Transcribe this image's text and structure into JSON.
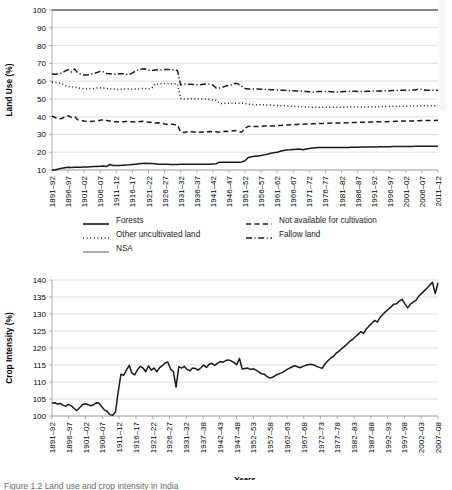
{
  "figure": {
    "caption": "Figure 1.2 Land use and crop intensity in India"
  },
  "chart_data": [
    {
      "id": "land-use",
      "type": "line",
      "title": "",
      "xlabel": "Years",
      "ylabel": "Land Use (%)",
      "ylim": [
        10,
        100
      ],
      "yticks": [
        10,
        20,
        30,
        40,
        50,
        60,
        70,
        80,
        90,
        100
      ],
      "ytick_labels": [
        "10",
        "20",
        "30",
        "40",
        "50",
        "60",
        "70",
        "80",
        "90",
        "100"
      ],
      "grid": true,
      "legend_position": "bottom",
      "categories": [
        "1891–92",
        "1896–97",
        "1901–02",
        "1906–07",
        "1911–12",
        "1916–17",
        "1921–22",
        "1926–27",
        "1931–32",
        "1936–37",
        "1941–42",
        "1946–47",
        "1951–52",
        "1956–57",
        "1961–62",
        "1966–67",
        "1971–72",
        "1976–77",
        "1981–82",
        "1986–87",
        "1991–92",
        "1996–97",
        "2001–02",
        "2006–07",
        "2011–12"
      ],
      "xtick_every": 5,
      "x_start_year": 1891,
      "x_end_year": 2012,
      "series": [
        {
          "name": "Forests",
          "style": "solid",
          "color": "#1a1a1a",
          "values": [
            9.9,
            10.0,
            10.6,
            11.0,
            11.3,
            11.5,
            11.4,
            11.6,
            11.5,
            11.6,
            11.7,
            11.7,
            11.8,
            11.9,
            12.0,
            12.1,
            12.2,
            12.0,
            13.1,
            12.5,
            12.6,
            12.6,
            12.7,
            12.8,
            12.9,
            13.1,
            13.3,
            13.5,
            13.7,
            13.8,
            13.6,
            13.6,
            13.5,
            13.3,
            13.2,
            13.2,
            13.2,
            13.1,
            13.1,
            13.1,
            13.2,
            13.2,
            13.2,
            13.2,
            13.2,
            13.2,
            13.3,
            13.3,
            13.3,
            13.3,
            13.4,
            13.5,
            14.3,
            14.4,
            14.4,
            14.4,
            14.4,
            14.4,
            14.4,
            14.5,
            15.2,
            17.0,
            17.4,
            17.7,
            17.9,
            18.1,
            18.5,
            18.9,
            19.4,
            19.7,
            20.0,
            20.5,
            21.0,
            21.3,
            21.4,
            21.6,
            21.7,
            21.8,
            21.4,
            21.8,
            22.1,
            22.4,
            22.5,
            22.6,
            22.6,
            22.6,
            22.6,
            22.6,
            22.6,
            22.7,
            22.7,
            22.7,
            22.7,
            22.8,
            22.8,
            22.8,
            22.9,
            22.9,
            22.9,
            23.0,
            23.0,
            23.0,
            23.1,
            23.1,
            23.1,
            23.1,
            23.2,
            23.2,
            23.2,
            23.2,
            23.2,
            23.2,
            23.2,
            23.3,
            23.3,
            23.3,
            23.3,
            23.3,
            23.3,
            23.3,
            23.3
          ],
          "description": "Forests rise from about 10% in 1891–92 to about 23% by 2011–12"
        },
        {
          "name": "Not available for cultivation",
          "style": "dashed",
          "color": "#1a1a1a",
          "values": [
            40.4,
            39.5,
            38.8,
            39.0,
            39.8,
            40.5,
            39.6,
            40.1,
            38.3,
            37.8,
            37.5,
            37.4,
            37.3,
            37.4,
            37.5,
            38.0,
            38.4,
            37.8,
            37.6,
            37.2,
            37.1,
            37.0,
            37.2,
            37.3,
            37.2,
            37.1,
            37.0,
            37.2,
            37.4,
            37.2,
            36.9,
            36.9,
            36.5,
            36.6,
            36.3,
            35.9,
            35.6,
            35.7,
            35.6,
            35.4,
            31.3,
            31.1,
            31.5,
            31.6,
            31.4,
            31.3,
            31.2,
            31.4,
            31.5,
            31.6,
            31.5,
            31.5,
            31.3,
            31.6,
            31.8,
            31.7,
            32.0,
            32.2,
            31.6,
            31.3,
            33.5,
            34.5,
            34.6,
            34.4,
            34.5,
            34.6,
            34.7,
            34.7,
            34.8,
            34.7,
            35.0,
            35.1,
            35.2,
            35.3,
            35.4,
            35.5,
            35.6,
            35.7,
            35.8,
            35.9,
            35.9,
            36.0,
            36.0,
            36.1,
            36.2,
            36.2,
            36.3,
            36.4,
            36.4,
            36.5,
            36.5,
            36.6,
            36.6,
            36.7,
            36.7,
            36.8,
            36.8,
            36.9,
            36.9,
            37.0,
            37.0,
            37.1,
            37.1,
            37.2,
            37.2,
            37.3,
            37.3,
            37.4,
            37.4,
            37.5,
            37.5,
            37.6,
            37.6,
            37.7,
            37.7,
            37.8,
            37.8,
            37.8,
            37.9,
            37.9,
            38.0
          ],
          "description": "Not available for cultivation falls from about 40% to about 31% near 1931–32 then rises to about 38%"
        },
        {
          "name": "Other uncultivated land",
          "style": "dotted",
          "color": "#1a1a1a",
          "values": [
            59.5,
            59.2,
            59.0,
            58.6,
            57.6,
            57.0,
            56.7,
            56.8,
            56.2,
            55.9,
            55.7,
            55.6,
            55.8,
            55.9,
            56.1,
            56.2,
            56.1,
            55.9,
            55.5,
            55.6,
            55.4,
            55.3,
            55.5,
            55.6,
            55.5,
            55.4,
            55.6,
            55.6,
            55.8,
            55.8,
            55.6,
            56.0,
            58.3,
            58.4,
            58.6,
            58.6,
            58.6,
            58.5,
            58.5,
            58.4,
            50.2,
            49.9,
            50.0,
            50.1,
            50.0,
            49.9,
            49.9,
            49.9,
            49.8,
            49.7,
            49.5,
            49.2,
            47.5,
            47.4,
            47.5,
            47.6,
            47.5,
            47.5,
            47.6,
            47.6,
            47.4,
            47.0,
            46.9,
            46.8,
            46.7,
            46.7,
            46.6,
            46.5,
            46.5,
            46.4,
            46.3,
            46.2,
            46.1,
            46.0,
            45.9,
            45.8,
            45.7,
            45.6,
            45.5,
            45.4,
            45.4,
            45.3,
            45.3,
            45.3,
            45.3,
            45.3,
            45.3,
            45.3,
            45.3,
            45.3,
            45.3,
            45.4,
            45.4,
            45.4,
            45.4,
            45.4,
            45.5,
            45.5,
            45.5,
            45.6,
            45.6,
            45.6,
            45.7,
            45.7,
            45.7,
            45.8,
            45.8,
            45.8,
            45.9,
            45.9,
            45.9,
            46.0,
            46.0,
            46.0,
            46.0,
            46.1,
            46.1,
            46.1,
            46.2,
            46.2,
            46.2
          ],
          "description": "Other uncultivated land falls from about 59% to about 46%"
        },
        {
          "name": "Fallow land",
          "style": "dashdot",
          "color": "#1a1a1a",
          "values": [
            64.1,
            63.8,
            64.0,
            64.4,
            65.6,
            66.4,
            65.2,
            66.8,
            64.6,
            63.8,
            63.4,
            63.5,
            63.9,
            64.2,
            64.8,
            65.6,
            65.2,
            64.3,
            64.2,
            63.9,
            63.8,
            64.1,
            64.2,
            63.9,
            63.6,
            64.6,
            65.8,
            66.4,
            66.8,
            66.9,
            66.1,
            66.0,
            66.3,
            66.4,
            66.3,
            66.5,
            66.6,
            66.3,
            66.2,
            66.0,
            57.8,
            58.4,
            58.3,
            58.2,
            58.1,
            58.0,
            57.9,
            58.2,
            58.4,
            58.3,
            57.8,
            56.1,
            56.1,
            56.5,
            57.2,
            57.6,
            58.0,
            58.8,
            58.3,
            57.1,
            55.9,
            55.6,
            55.5,
            55.6,
            55.5,
            55.4,
            55.3,
            55.3,
            55.2,
            55.1,
            55.0,
            54.9,
            54.8,
            54.7,
            54.6,
            54.6,
            54.5,
            54.4,
            54.2,
            54.1,
            54.0,
            53.9,
            54.0,
            54.1,
            54.2,
            54.2,
            54.1,
            54.0,
            53.9,
            53.9,
            54.0,
            54.1,
            54.2,
            54.3,
            54.3,
            54.2,
            54.2,
            54.2,
            54.3,
            54.3,
            54.4,
            54.4,
            54.5,
            54.5,
            54.6,
            54.6,
            54.7,
            54.7,
            54.8,
            54.8,
            54.9,
            54.9,
            55.0,
            55.0,
            55.6,
            55.4,
            54.9,
            54.8,
            54.8,
            54.9,
            54.9
          ],
          "description": "Fallow land hovers near 64–66% until 1931–32 then drops to about 55%"
        },
        {
          "name": "NSA",
          "style": "solid-thin",
          "color": "#5a5a5a",
          "values": [
            100,
            100,
            100,
            100,
            100,
            100,
            100,
            100,
            100,
            100,
            100,
            100,
            100,
            100,
            100,
            100,
            100,
            100,
            100,
            100,
            100,
            100,
            100,
            100,
            100,
            100,
            100,
            100,
            100,
            100,
            100,
            100,
            100,
            100,
            100,
            100,
            100,
            100,
            100,
            100,
            100,
            100,
            100,
            100,
            100,
            100,
            100,
            100,
            100,
            100,
            100,
            100,
            100,
            100,
            100,
            100,
            100,
            100,
            100,
            100,
            100,
            100,
            100,
            100,
            100,
            100,
            100,
            100,
            100,
            100,
            100,
            100,
            100,
            100,
            100,
            100,
            100,
            100,
            100,
            100,
            100,
            100,
            100,
            100,
            100,
            100,
            100,
            100,
            100,
            100,
            100,
            100,
            100,
            100,
            100,
            100,
            100,
            100,
            100,
            100,
            100,
            100,
            100,
            100,
            100,
            100,
            100,
            100,
            100,
            100,
            100,
            100,
            100,
            100,
            100,
            100,
            100,
            100,
            100,
            100,
            100
          ],
          "description": "NSA is the cumulative total at 100%"
        }
      ],
      "legend": [
        {
          "label": "Forests",
          "style": "solid"
        },
        {
          "label": "Not available for cultivation",
          "style": "dashed"
        },
        {
          "label": "Other uncultivated land",
          "style": "dotted"
        },
        {
          "label": "Fallow land",
          "style": "dashdot"
        },
        {
          "label": "NSA",
          "style": "solid-thin"
        }
      ]
    },
    {
      "id": "crop-intensity",
      "type": "line",
      "title": "",
      "xlabel": "Years",
      "ylabel": "Crop Intensity (%)",
      "ylim": [
        100,
        140
      ],
      "yticks": [
        100,
        105,
        110,
        115,
        120,
        125,
        130,
        135,
        140
      ],
      "ytick_labels": [
        "100",
        "105",
        "110",
        "115",
        "120",
        "125",
        "130",
        "135",
        "140"
      ],
      "grid": true,
      "legend_position": "none",
      "categories": [
        "1891–92",
        "1896–97",
        "1901–02",
        "1906–07",
        "1911–12",
        "1916–17",
        "1921–22",
        "1926–27",
        "1931–32",
        "1937–38",
        "1942–43",
        "1947–48",
        "1952–53",
        "1957–58",
        "1962–63",
        "1967–68",
        "1972–73",
        "1977–78",
        "1982–83",
        "1987–88",
        "1992–93",
        "1997–98",
        "2002–03",
        "2007–08"
      ],
      "xtick_every": 5,
      "series": [
        {
          "name": "Crop intensity",
          "style": "solid",
          "color": "#3a3a3a",
          "values": [
            103.8,
            103.9,
            103.5,
            103.7,
            103.2,
            102.9,
            103.4,
            103.0,
            102.2,
            101.6,
            102.4,
            103.3,
            103.6,
            103.4,
            103.0,
            103.3,
            103.9,
            103.8,
            102.8,
            101.8,
            101.4,
            100.4,
            100.2,
            101.1,
            107.0,
            112.3,
            112.0,
            113.5,
            114.9,
            112.6,
            112.1,
            113.6,
            114.6,
            114.1,
            113.0,
            114.7,
            113.5,
            114.1,
            113.0,
            114.2,
            114.8,
            115.6,
            115.9,
            113.8,
            113.1,
            108.5,
            114.5,
            114.1,
            114.6,
            113.7,
            113.3,
            114.1,
            114.0,
            113.5,
            114.2,
            115.0,
            114.3,
            115.2,
            115.5,
            114.9,
            115.5,
            116.0,
            115.8,
            116.3,
            116.5,
            116.2,
            115.7,
            115.1,
            116.9,
            113.8,
            114.0,
            114.1,
            113.7,
            113.9,
            113.5,
            113.0,
            112.4,
            112.3,
            111.6,
            111.2,
            111.4,
            111.9,
            112.3,
            112.6,
            113.0,
            113.6,
            114.0,
            114.4,
            114.8,
            114.5,
            114.2,
            114.6,
            114.9,
            115.1,
            115.2,
            115.0,
            114.6,
            114.3,
            114.0,
            115.3,
            116.2,
            117.0,
            117.5,
            118.4,
            119.0,
            119.8,
            120.4,
            121.2,
            122.0,
            122.5,
            123.3,
            124.0,
            124.8,
            124.3,
            125.6,
            126.5,
            127.3,
            128.1,
            127.6,
            129.0,
            129.9,
            130.7,
            131.4,
            132.1,
            132.9,
            133.0,
            133.8,
            134.3,
            133.0,
            131.8,
            132.9,
            133.5,
            134.0,
            135.2,
            136.0,
            136.8,
            137.6,
            138.5,
            139.3,
            136.0,
            139.2
          ],
          "description": "Crop intensity rises from about 104% in 1891–92 to about 139% by 2010"
        }
      ]
    }
  ]
}
